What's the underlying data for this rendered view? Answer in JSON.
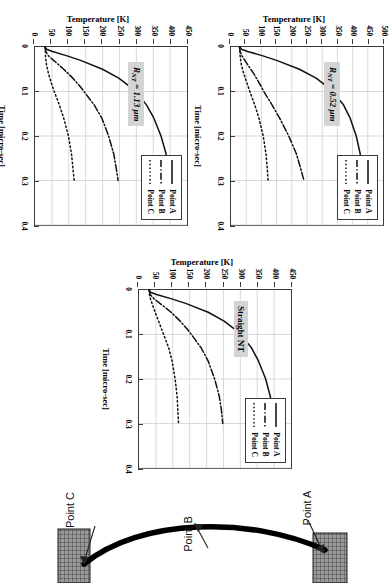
{
  "figure": {
    "charts": [
      {
        "id": "chart-rnt-113",
        "badge": "R",
        "badge_sub": "NT",
        "badge_rest": " = 1.13 μm",
        "badge_full": "R_NT = 1.13 μm",
        "xlabel": "Time [micro-sec]",
        "ylabel": "Temperature [K]",
        "xticks": [
          "0",
          "0.1",
          "0.2",
          "0.3",
          "0.4"
        ],
        "yticks": [
          "0",
          "50",
          "100",
          "150",
          "200",
          "250",
          "300",
          "350",
          "400",
          "450"
        ],
        "legend": [
          "Point A",
          "Point B",
          "Point C"
        ]
      },
      {
        "id": "chart-rnt-052",
        "badge": "R",
        "badge_sub": "NT",
        "badge_rest": " = 0.52 μm",
        "badge_full": "R_NT = 0.52 μm",
        "xlabel": "Time [micro-sec]",
        "ylabel": "Temperature [K]",
        "xticks": [
          "0",
          "0.1",
          "0.2",
          "0.3",
          "0.4"
        ],
        "yticks": [
          "0",
          "50",
          "100",
          "150",
          "200",
          "250",
          "300",
          "350",
          "400",
          "450",
          "500"
        ],
        "legend": [
          "Point A",
          "Point B",
          "Point C"
        ]
      },
      {
        "id": "chart-straight-nt",
        "badge_full": "Straight NT",
        "xlabel": "Time [micro-sec]",
        "ylabel": "Temperature [K]",
        "xticks": [
          "0",
          "0.1",
          "0.2",
          "0.3",
          "0.4"
        ],
        "yticks": [
          "0",
          "50",
          "100",
          "150",
          "200",
          "250",
          "300",
          "350",
          "400",
          "450"
        ],
        "legend": [
          "Point A",
          "Point B",
          "Point C"
        ]
      }
    ],
    "diagram": {
      "label_a": "Point A",
      "label_b": "Point B",
      "label_c": "Point C"
    }
  },
  "chart_data": [
    {
      "type": "line",
      "id": "chart-rnt-113",
      "title": "R_NT = 1.13 μm",
      "xlabel": "Time [micro-sec]",
      "ylabel": "Temperature [K]",
      "xlim": [
        0,
        0.4
      ],
      "ylim": [
        0,
        450
      ],
      "xticks": [
        0,
        0.1,
        0.2,
        0.3,
        0.4
      ],
      "yticks": [
        0,
        50,
        100,
        150,
        200,
        250,
        300,
        350,
        400,
        450
      ],
      "grid": true,
      "legend_position": "upper-right-inside",
      "series": [
        {
          "name": "Point A",
          "style": "solid",
          "x": [
            0,
            0.005,
            0.01,
            0.02,
            0.03,
            0.05,
            0.07,
            0.09,
            0.1,
            0.13,
            0.16,
            0.2,
            0.24,
            0.27,
            0.3
          ],
          "y": [
            30,
            34,
            52,
            95,
            135,
            200,
            248,
            283,
            298,
            330,
            352,
            373,
            388,
            395,
            400
          ]
        },
        {
          "name": "Point B",
          "style": "dashdot",
          "x": [
            0,
            0.01,
            0.02,
            0.03,
            0.05,
            0.07,
            0.09,
            0.1,
            0.13,
            0.16,
            0.2,
            0.24,
            0.27,
            0.3
          ],
          "y": [
            30,
            32,
            40,
            55,
            85,
            112,
            135,
            145,
            175,
            198,
            218,
            233,
            240,
            246
          ]
        },
        {
          "name": "Point C",
          "style": "dotted",
          "x": [
            0,
            0.02,
            0.04,
            0.06,
            0.08,
            0.1,
            0.13,
            0.16,
            0.2,
            0.24,
            0.27,
            0.3
          ],
          "y": [
            30,
            31,
            34,
            40,
            48,
            57,
            72,
            85,
            99,
            108,
            112,
            116
          ]
        }
      ]
    },
    {
      "type": "line",
      "id": "chart-rnt-052",
      "title": "R_NT = 0.52 μm",
      "xlabel": "Time [micro-sec]",
      "ylabel": "Temperature [K]",
      "xlim": [
        0,
        0.4
      ],
      "ylim": [
        0,
        500
      ],
      "xticks": [
        0,
        0.1,
        0.2,
        0.3,
        0.4
      ],
      "yticks": [
        0,
        50,
        100,
        150,
        200,
        250,
        300,
        350,
        400,
        450,
        500
      ],
      "grid": true,
      "legend_position": "upper-right-inside",
      "series": [
        {
          "name": "Point A",
          "style": "solid",
          "x": [
            0,
            0.005,
            0.01,
            0.02,
            0.03,
            0.05,
            0.07,
            0.09,
            0.1,
            0.13,
            0.16,
            0.2,
            0.24,
            0.27,
            0.3
          ],
          "y": [
            30,
            34,
            55,
            105,
            150,
            225,
            280,
            318,
            333,
            370,
            392,
            412,
            425,
            431,
            436
          ]
        },
        {
          "name": "Point B",
          "style": "dashdot",
          "x": [
            0,
            0.01,
            0.02,
            0.04,
            0.06,
            0.08,
            0.1,
            0.13,
            0.16,
            0.2,
            0.24,
            0.27,
            0.3
          ],
          "y": [
            28,
            30,
            36,
            55,
            75,
            92,
            108,
            135,
            160,
            190,
            215,
            228,
            240
          ]
        },
        {
          "name": "Point C",
          "style": "dotted",
          "x": [
            0,
            0.02,
            0.04,
            0.06,
            0.08,
            0.1,
            0.13,
            0.16,
            0.2,
            0.24,
            0.27,
            0.3
          ],
          "y": [
            28,
            30,
            34,
            42,
            52,
            62,
            78,
            92,
            106,
            115,
            119,
            122
          ]
        }
      ]
    },
    {
      "type": "line",
      "id": "chart-straight-nt",
      "title": "Straight NT",
      "xlabel": "Time [micro-sec]",
      "ylabel": "Temperature [K]",
      "xlim": [
        0,
        0.4
      ],
      "ylim": [
        0,
        450
      ],
      "xticks": [
        0,
        0.1,
        0.2,
        0.3,
        0.4
      ],
      "yticks": [
        0,
        50,
        100,
        150,
        200,
        250,
        300,
        350,
        400,
        450
      ],
      "grid": true,
      "legend_position": "upper-right-inside",
      "series": [
        {
          "name": "Point A",
          "style": "solid",
          "x": [
            0,
            0.005,
            0.01,
            0.02,
            0.03,
            0.05,
            0.07,
            0.09,
            0.1,
            0.13,
            0.16,
            0.2,
            0.24,
            0.27,
            0.3
          ],
          "y": [
            30,
            34,
            52,
            97,
            138,
            205,
            252,
            287,
            300,
            333,
            354,
            375,
            389,
            395,
            400
          ]
        },
        {
          "name": "Point B",
          "style": "dashdot",
          "x": [
            0,
            0.01,
            0.02,
            0.03,
            0.05,
            0.07,
            0.09,
            0.1,
            0.13,
            0.16,
            0.2,
            0.24,
            0.27,
            0.3
          ],
          "y": [
            30,
            33,
            45,
            62,
            95,
            122,
            145,
            155,
            184,
            205,
            224,
            238,
            244,
            248
          ]
        },
        {
          "name": "Point C",
          "style": "dotted",
          "x": [
            0,
            0.01,
            0.02,
            0.04,
            0.06,
            0.08,
            0.1,
            0.13,
            0.16,
            0.2,
            0.24,
            0.27,
            0.3
          ],
          "y": [
            30,
            31,
            34,
            43,
            53,
            63,
            73,
            88,
            98,
            107,
            113,
            115,
            117
          ]
        }
      ]
    }
  ]
}
